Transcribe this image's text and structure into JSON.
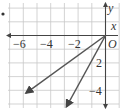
{
  "figure": {
    "bullet": "•",
    "axes": {
      "x_label": "x",
      "y_label": "y",
      "origin_label": "O",
      "x_ticks": [
        {
          "value": -6,
          "label": "−6"
        },
        {
          "value": -4,
          "label": "−4"
        },
        {
          "value": -2,
          "label": "−2"
        }
      ],
      "y_ticks": [
        {
          "value": -2,
          "label": "2"
        },
        {
          "value": -4,
          "label": "−4"
        }
      ]
    },
    "grid": {
      "x_range": [
        -7,
        1
      ],
      "y_range": [
        -5,
        2
      ],
      "step": 1,
      "color": "#c8c8c8"
    },
    "rays": [
      {
        "name": "ray-1",
        "from": [
          0,
          0
        ],
        "to": [
          -5.8,
          -4.2
        ],
        "color": "#555555"
      },
      {
        "name": "ray-2",
        "from": [
          0,
          0
        ],
        "to": [
          -2.85,
          -5.2
        ],
        "color": "#555555"
      }
    ]
  }
}
